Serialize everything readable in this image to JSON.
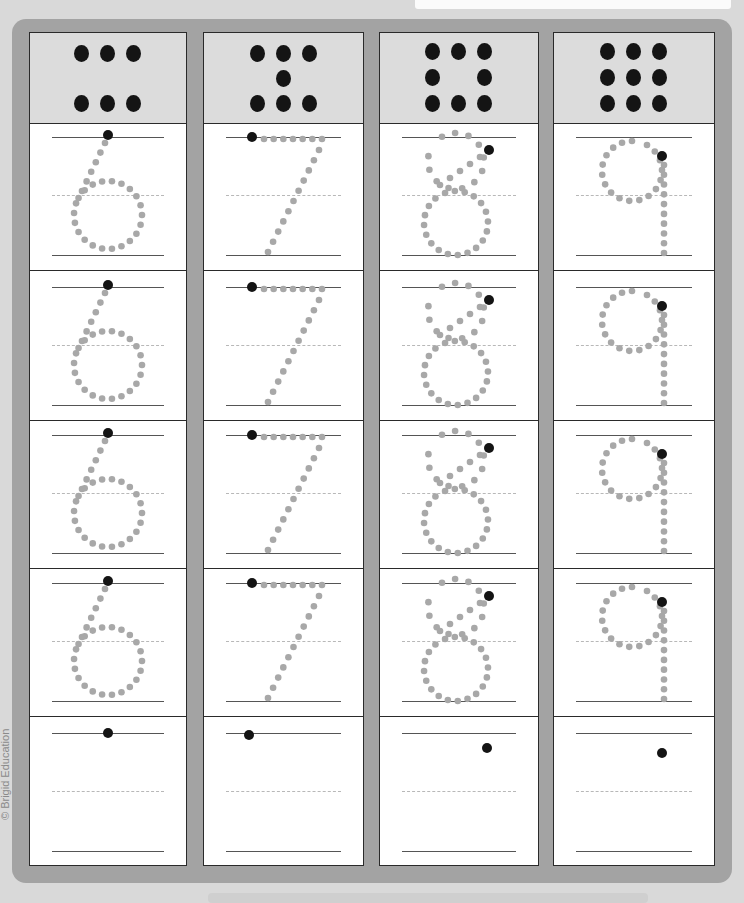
{
  "page": {
    "copyright": "© Brigid Education",
    "colors": {
      "frame": "#a3a3a3",
      "header": "#dcdcdc",
      "trace_dot": "#a8a8a8",
      "start_dot": "#141414",
      "border": "#2a2a2a"
    }
  },
  "columns": [
    {
      "digit": "6",
      "dot_count": 6,
      "pattern": "two rows of three",
      "rows_traced": 4,
      "rows_blank": 1
    },
    {
      "digit": "7",
      "dot_count": 7,
      "pattern": "three, one center, three",
      "rows_traced": 4,
      "rows_blank": 1
    },
    {
      "digit": "8",
      "dot_count": 8,
      "pattern": "ring of eight",
      "rows_traced": 4,
      "rows_blank": 1
    },
    {
      "digit": "9",
      "dot_count": 9,
      "pattern": "3x3 grid",
      "rows_traced": 4,
      "rows_blank": 1
    }
  ]
}
